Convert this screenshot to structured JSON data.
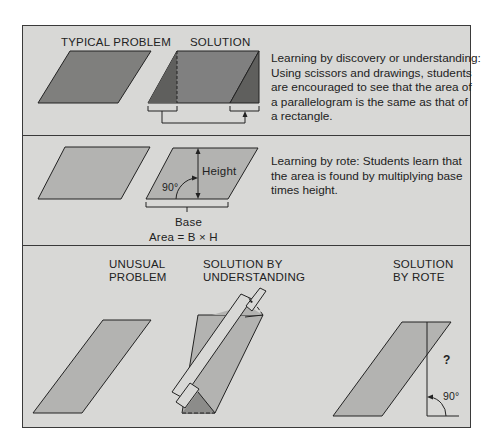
{
  "panels": {
    "discovery": {
      "labels": {
        "typical_problem": "TYPICAL PROBLEM",
        "solution": "SOLUTION"
      },
      "caption_lines": [
        "Learning by discovery or understanding:",
        "Using scissors and drawings, students",
        "are encouraged to see that the area of",
        "a parallelogram is the same as that of",
        "a rectangle."
      ]
    },
    "rote": {
      "labels": {
        "height": "Height",
        "angle": "90°",
        "base": "Base",
        "formula": "Area = B × H"
      },
      "caption_lines": [
        "Learning by rote: Students learn that",
        "the area is found by multiplying base",
        "times height."
      ]
    },
    "comparison": {
      "labels": {
        "unusual_problem": [
          "UNUSUAL",
          "PROBLEM"
        ],
        "solution_understanding": [
          "SOLUTION BY",
          "UNDERSTANDING"
        ],
        "solution_rote": [
          "SOLUTION",
          "BY ROTE"
        ],
        "question_mark": "?",
        "angle": "90°"
      }
    }
  },
  "colors": {
    "panel_bg": "#d8d8d6",
    "shape_dark": "#7f7f7d",
    "shape_darker": "#5f5f5d",
    "shape_light": "#b3b3b1",
    "stroke": "#222222"
  }
}
